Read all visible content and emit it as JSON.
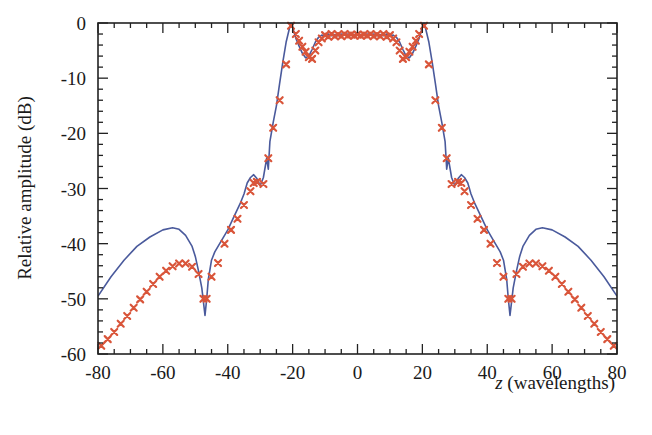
{
  "chart_data": {
    "type": "line",
    "title": "",
    "xlabel_italic": "z",
    "xlabel_rest": " (wavelengths)",
    "xlabel": "z (wavelengths)",
    "ylabel": "Relative amplitude (dB)",
    "xlim": [
      -80,
      80
    ],
    "ylim": [
      -60,
      0
    ],
    "xticks": [
      -80,
      -60,
      -40,
      -20,
      0,
      20,
      40,
      60,
      80
    ],
    "yticks": [
      0,
      -10,
      -20,
      -30,
      -40,
      -50,
      -60
    ],
    "x_minor_step": 5,
    "y_minor_step": 2,
    "grid": false,
    "legend": null,
    "colors": {
      "line": "#4a5a9c",
      "markers": "#d9553a",
      "axis": "#222222"
    },
    "series": [
      {
        "name": "solid-line",
        "style": "line",
        "x": [
          -80,
          -76,
          -72,
          -68,
          -64,
          -60,
          -57,
          -55,
          -53,
          -51,
          -50,
          -49,
          -48,
          -47.5,
          -47,
          -46.5,
          -46,
          -45,
          -44,
          -42,
          -40,
          -38,
          -36,
          -35,
          -34,
          -33,
          -32,
          -31,
          -30,
          -29,
          -28,
          -27.5,
          -27,
          -26,
          -25,
          -24,
          -23,
          -22,
          -21,
          -20.5,
          -20,
          -19,
          -18,
          -17,
          -16,
          -15,
          -14,
          -13,
          -12,
          -11,
          -10,
          -9,
          -8,
          -7,
          -6,
          -5,
          -4,
          -3,
          -2,
          -1,
          0,
          1,
          2,
          3,
          4,
          5,
          6,
          7,
          8,
          9,
          10,
          11,
          12,
          13,
          14,
          15,
          16,
          17,
          18,
          19,
          20,
          20.5,
          21,
          22,
          23,
          24,
          25,
          26,
          27,
          27.5,
          28,
          29,
          30,
          31,
          32,
          33,
          34,
          35,
          36,
          38,
          40,
          42,
          44,
          45,
          46,
          46.5,
          47,
          47.5,
          48,
          49,
          50,
          51,
          53,
          55,
          57,
          60,
          64,
          68,
          72,
          76,
          80
        ],
        "y": [
          -49.5,
          -46,
          -43,
          -40.5,
          -38.8,
          -37.5,
          -37.1,
          -37.4,
          -38.5,
          -40.5,
          -42.3,
          -45,
          -48,
          -50.5,
          -53,
          -50,
          -46.5,
          -43,
          -41.5,
          -39.5,
          -37.5,
          -35,
          -32.5,
          -31,
          -29,
          -28,
          -27.5,
          -28.2,
          -29.5,
          -28,
          -24.5,
          -26.5,
          -21.5,
          -18,
          -15,
          -11,
          -7,
          -3.5,
          -1,
          0,
          -0.8,
          -2.8,
          -4.2,
          -5.5,
          -6.3,
          -6,
          -4.8,
          -3.5,
          -2.6,
          -2.2,
          -2.4,
          -2.0,
          -2.3,
          -2.1,
          -2.3,
          -2.0,
          -2.2,
          -2.0,
          -2.2,
          -2.1,
          -2.0,
          -2.1,
          -2.2,
          -2.0,
          -2.2,
          -2.0,
          -2.3,
          -2.1,
          -2.3,
          -2.0,
          -2.4,
          -2.2,
          -2.6,
          -3.5,
          -4.8,
          -6,
          -6.3,
          -5.5,
          -4.2,
          -2.8,
          -0.8,
          0,
          -1,
          -3.5,
          -7,
          -11,
          -15,
          -18,
          -21.5,
          -26.5,
          -24.5,
          -28,
          -29.5,
          -28.2,
          -27.5,
          -28,
          -29,
          -31,
          -32.5,
          -35,
          -37.5,
          -39.5,
          -41.5,
          -43,
          -46.5,
          -50,
          -53,
          -50.5,
          -48,
          -45,
          -42.3,
          -40.5,
          -38.5,
          -37.4,
          -37.1,
          -37.5,
          -38.8,
          -40.5,
          -43,
          -46,
          -49.5
        ]
      },
      {
        "name": "x-markers",
        "style": "marker",
        "x": [
          -79,
          -77,
          -75,
          -73,
          -71,
          -69,
          -67,
          -65,
          -63,
          -61,
          -59,
          -57,
          -55,
          -53,
          -51,
          -49,
          -47.5,
          -46.5,
          -45,
          -43,
          -41,
          -39,
          -37,
          -35,
          -33,
          -32,
          -31,
          -29,
          -27.5,
          -26,
          -24,
          -22,
          -20.5,
          -19,
          -18,
          -17,
          -16,
          -15,
          -14,
          -13,
          -12,
          -11,
          -10,
          -9,
          -8,
          -7,
          -6,
          -5,
          -4,
          -3,
          -2,
          -1,
          0,
          1,
          2,
          3,
          4,
          5,
          6,
          7,
          8,
          9,
          10,
          11,
          12,
          13,
          14,
          15,
          16,
          17,
          18,
          19,
          20.5,
          22,
          24,
          26,
          27.5,
          29,
          31,
          32,
          33,
          35,
          37,
          39,
          41,
          43,
          45,
          46.5,
          47.5,
          49,
          51,
          53,
          55,
          57,
          59,
          61,
          63,
          65,
          67,
          69,
          71,
          73,
          75,
          77,
          79
        ],
        "y": [
          -58.5,
          -57.3,
          -56,
          -54.5,
          -53.1,
          -51.6,
          -50.1,
          -48.7,
          -47.3,
          -46,
          -44.9,
          -44.1,
          -43.6,
          -43.6,
          -44.2,
          -45.5,
          -50,
          -50,
          -46,
          -43.5,
          -40,
          -37.5,
          -35.5,
          -33,
          -30.5,
          -29,
          -28.8,
          -29.2,
          -24.5,
          -19,
          -14,
          -7.5,
          -0.5,
          -2,
          -3.2,
          -4.3,
          -5.2,
          -6.2,
          -6.5,
          -5,
          -3.5,
          -2.8,
          -2.2,
          -2.5,
          -2.0,
          -2.4,
          -2.1,
          -2.4,
          -2.0,
          -2.3,
          -2.1,
          -2.3,
          -2.1,
          -2.3,
          -2.1,
          -2.3,
          -2.0,
          -2.4,
          -2.1,
          -2.4,
          -2.0,
          -2.5,
          -2.2,
          -2.8,
          -3.5,
          -5,
          -6.5,
          -6.2,
          -5.2,
          -4.3,
          -3.2,
          -2,
          -0.5,
          -7.5,
          -14,
          -19,
          -24.5,
          -29.2,
          -28.8,
          -29,
          -30.5,
          -33,
          -35.5,
          -37.5,
          -40,
          -43.5,
          -46,
          -50,
          -50,
          -45.5,
          -44.2,
          -43.6,
          -43.6,
          -44.1,
          -44.9,
          -46,
          -47.3,
          -48.7,
          -50.1,
          -51.6,
          -53.1,
          -54.5,
          -56,
          -57.3,
          -58.5
        ]
      }
    ]
  }
}
